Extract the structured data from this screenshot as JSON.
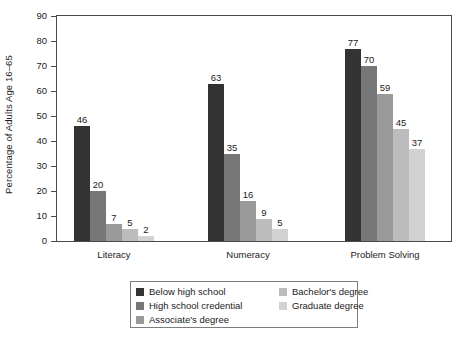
{
  "chart_data": {
    "type": "bar",
    "title": "",
    "subtitle": "",
    "xlabel": "",
    "ylabel": "Percentage of Adults Age 16–65",
    "ylim": [
      0,
      90
    ],
    "ytick_step": 10,
    "yticks": [
      0,
      10,
      20,
      30,
      40,
      50,
      60,
      70,
      80,
      90
    ],
    "grid": false,
    "legend_position": "bottom-center",
    "categories": [
      "Literacy",
      "Numeracy",
      "Problem Solving"
    ],
    "series": [
      {
        "name": "Below high school",
        "color": "#333333",
        "values": [
          46,
          63,
          77
        ]
      },
      {
        "name": "High school credential",
        "color": "#777777",
        "values": [
          20,
          35,
          70
        ]
      },
      {
        "name": "Associate's degree",
        "color": "#9a9a9a",
        "values": [
          7,
          16,
          59
        ]
      },
      {
        "name": "Bachelor's degree",
        "color": "#bcbcbc",
        "values": [
          5,
          9,
          45
        ]
      },
      {
        "name": "Graduate degree",
        "color": "#d2d2d2",
        "values": [
          2,
          5,
          37
        ]
      }
    ],
    "legend_columns": [
      [
        "Below high school",
        "High school credential",
        "Associate's degree"
      ],
      [
        "Bachelor's degree",
        "Graduate degree"
      ]
    ]
  }
}
